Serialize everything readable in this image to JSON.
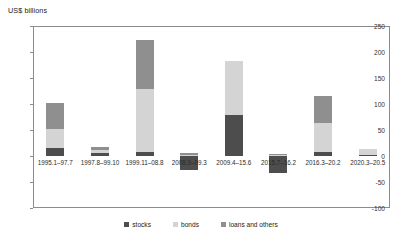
{
  "chart_data": {
    "type": "bar",
    "title": "",
    "subtitle": "",
    "ylabel": "US$ billions",
    "xlabel": "",
    "ylim": [
      -100,
      250
    ],
    "yticks": [
      -100,
      -50,
      0,
      50,
      100,
      150,
      200,
      250
    ],
    "ytick_labels": [
      "-100",
      "-50",
      "0",
      "50",
      "100",
      "150",
      "200",
      "250"
    ],
    "grid": false,
    "stacked": true,
    "legend_position": "bottom",
    "categories": [
      "1995.1–97.7",
      "1997.8–99.10",
      "1999.11–08.8",
      "2008.9–09.3",
      "2009.4–15.6",
      "2015.7–16.2",
      "2016.3–20.2",
      "2020.3–20.5"
    ],
    "series": [
      {
        "name": "stocks",
        "color": "#4d4d4d",
        "values": [
          15,
          5,
          8,
          -27,
          78,
          -32,
          7,
          2
        ]
      },
      {
        "name": "bonds",
        "color": "#d4d4d4",
        "values": [
          37,
          6,
          120,
          2,
          104,
          2,
          57,
          12
        ]
      },
      {
        "name": "loans and others",
        "color": "#8f8f8f",
        "values": [
          50,
          7,
          95,
          3,
          0,
          2,
          51,
          0
        ]
      }
    ],
    "totals": [
      102,
      18,
      223,
      -22,
      182,
      -28,
      115,
      14
    ],
    "legend": [
      "stocks",
      "bonds",
      "loans and others"
    ]
  }
}
